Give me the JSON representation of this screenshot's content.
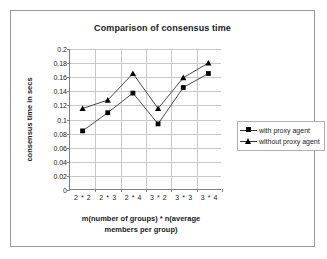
{
  "chart_data": {
    "type": "line",
    "title": "Comparison of consensus time",
    "xlabel": "m(number of groups) * n(average members per group)",
    "ylabel": "consensus time in secs",
    "categories": [
      "2 * 2",
      "2 * 3",
      "2 * 4",
      "3 * 2",
      "3 * 3",
      "3 * 4"
    ],
    "series": [
      {
        "name": "with proxy agent",
        "marker": "square",
        "values": [
          0.083,
          0.109,
          0.137,
          0.093,
          0.145,
          0.165
        ]
      },
      {
        "name": "without proxy agent",
        "marker": "triangle",
        "values": [
          0.115,
          0.127,
          0.165,
          0.115,
          0.159,
          0.18
        ]
      }
    ],
    "ylim": [
      0,
      0.2
    ],
    "ytick_step": 0.02,
    "ytick_labels": [
      "0.2",
      "0.18",
      "0.16",
      "0.14",
      "0.12",
      "0.1",
      "0.08",
      "0.06",
      "0.04",
      "0.02",
      "0"
    ],
    "grid": "horizontal-and-vertical",
    "legend_position": "right",
    "line_color": "#333333",
    "marker_color": "#000000",
    "grid_color": "#c8c8c8",
    "axis_color": "#808080"
  },
  "xlabel_lines": [
    "m(number of groups) * n(average",
    "members per group)"
  ],
  "legend": {
    "items": [
      {
        "label": "with proxy agent"
      },
      {
        "label": "without proxy agent"
      }
    ]
  }
}
